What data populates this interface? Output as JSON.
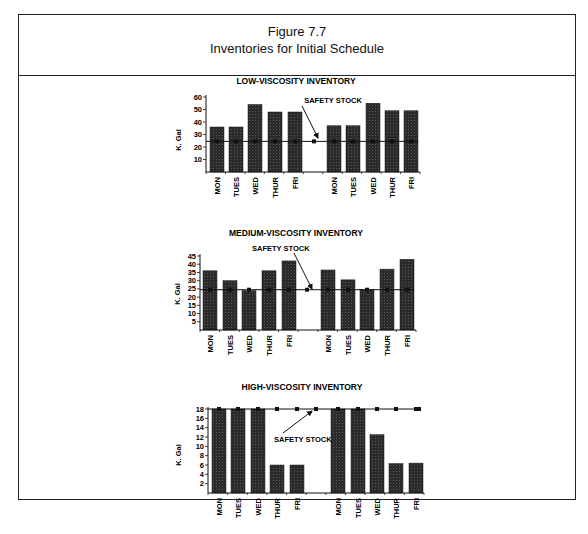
{
  "figure": {
    "number": "Figure 7.7",
    "title": "Inventories for Initial Schedule"
  },
  "chart_data": [
    {
      "type": "bar",
      "title": "LOW-VISCOSITY INVENTORY",
      "ylabel": "K. Gal",
      "xlabel": "",
      "ylim": [
        0,
        60
      ],
      "yticks": [
        10,
        20,
        30,
        40,
        50,
        60
      ],
      "categories": [
        "MON",
        "TUES",
        "WED",
        "THUR",
        "FRI",
        "MON",
        "TUES",
        "WED",
        "THUR",
        "FRI"
      ],
      "values": [
        36,
        36,
        54,
        48,
        48,
        37,
        37,
        55,
        49,
        49
      ],
      "safety_stock": {
        "label": "SAFETY STOCK",
        "value": 24.5,
        "type": "line"
      },
      "grid": false,
      "legend": "none"
    },
    {
      "type": "bar",
      "title": "MEDIUM-VISCOSITY INVENTORY",
      "ylabel": "K. Gal",
      "xlabel": "",
      "ylim": [
        0,
        45
      ],
      "yticks": [
        5,
        10,
        15,
        20,
        25,
        30,
        35,
        40,
        45
      ],
      "categories": [
        "MON",
        "TUES",
        "WED",
        "THUR",
        "FRI",
        "MON",
        "TUES",
        "WED",
        "THUR",
        "FRI"
      ],
      "values": [
        36,
        30,
        24,
        36,
        42,
        36.5,
        30.5,
        24.5,
        37,
        43
      ],
      "safety_stock": {
        "label": "SAFETY STOCK",
        "value": 24.5,
        "type": "line"
      },
      "grid": false,
      "legend": "none"
    },
    {
      "type": "bar",
      "title": "HIGH-VISCOSITY INVENTORY",
      "ylabel": "K. Gal",
      "xlabel": "",
      "ylim": [
        0,
        18
      ],
      "yticks": [
        2,
        4,
        6,
        8,
        10,
        12,
        14,
        16,
        18
      ],
      "categories": [
        "MON",
        "TUES",
        "WED",
        "THUR",
        "FRI",
        "MON",
        "TUES",
        "WED",
        "THUR",
        "FRI"
      ],
      "values": [
        18,
        18,
        18,
        6,
        6,
        18,
        18,
        12.5,
        6.3,
        6.4
      ],
      "safety_stock": {
        "label": "SAFETY STOCK",
        "value": 18,
        "type": "line"
      },
      "grid": false,
      "legend": "none"
    }
  ],
  "colors": {
    "bar": "#2b2b2b",
    "line": "#222222",
    "border": "#222222"
  }
}
